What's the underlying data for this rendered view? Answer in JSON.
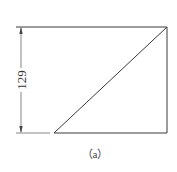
{
  "diagram": {
    "dimension_label": "129",
    "caption": "（a）",
    "colors": {
      "line": "#3a3a3a",
      "background": "#ffffff"
    }
  }
}
